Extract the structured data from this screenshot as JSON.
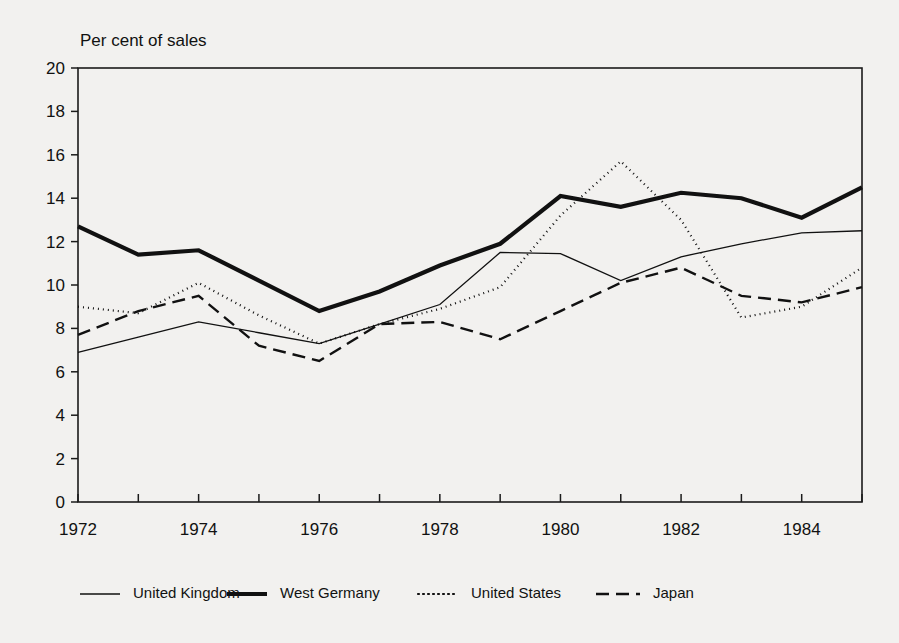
{
  "chart_data": {
    "type": "line",
    "title": "",
    "ylabel": "Per cent of sales",
    "xlabel": "",
    "ylim": [
      0,
      20
    ],
    "xlim": [
      1972,
      1985
    ],
    "ytick_step": 2,
    "yticks": [
      0,
      2,
      4,
      6,
      8,
      10,
      12,
      14,
      16,
      18,
      20
    ],
    "ytick_labels": [
      "0",
      "2",
      "4",
      "6",
      "8",
      "10",
      "12",
      "14",
      "16",
      "18",
      "20"
    ],
    "x": [
      1972,
      1973,
      1974,
      1975,
      1976,
      1977,
      1978,
      1979,
      1980,
      1981,
      1982,
      1983,
      1984,
      1985
    ],
    "xticks": [
      1972,
      1973,
      1974,
      1975,
      1976,
      1977,
      1978,
      1979,
      1980,
      1981,
      1982,
      1983,
      1984,
      1985
    ],
    "xtick_labels": [
      "1972",
      "",
      "1974",
      "",
      "1976",
      "",
      "1978",
      "",
      "1980",
      "",
      "1982",
      "",
      "1984",
      ""
    ],
    "grid": false,
    "legend_position": "bottom",
    "series": [
      {
        "name": "United Kingdom",
        "style": "solid-thin",
        "color": "#111111",
        "width": 1.3,
        "dash": "none",
        "values": [
          6.9,
          7.6,
          8.3,
          7.8,
          7.3,
          8.2,
          9.1,
          11.5,
          11.45,
          10.2,
          11.3,
          11.9,
          12.4,
          12.5
        ]
      },
      {
        "name": "West Germany",
        "style": "solid-thick",
        "color": "#111111",
        "width": 4.2,
        "dash": "none",
        "values": [
          12.7,
          11.4,
          11.6,
          10.2,
          8.8,
          9.7,
          10.9,
          11.9,
          14.1,
          13.6,
          14.25,
          14.0,
          13.1,
          14.5
        ]
      },
      {
        "name": "United States",
        "style": "dotted",
        "color": "#111111",
        "width": 2.2,
        "dash": "1 4",
        "values": [
          9.0,
          8.7,
          10.1,
          8.6,
          7.3,
          8.2,
          8.9,
          9.9,
          13.2,
          15.7,
          13.0,
          8.5,
          9.0,
          10.8
        ]
      },
      {
        "name": "Japan",
        "style": "dashed",
        "color": "#111111",
        "width": 2.4,
        "dash": "13 7",
        "values": [
          7.7,
          8.8,
          9.5,
          7.2,
          6.5,
          8.2,
          8.3,
          7.5,
          8.8,
          10.1,
          10.8,
          9.5,
          9.2,
          9.9
        ]
      }
    ],
    "legend": [
      {
        "label": "United Kingdom",
        "style": "solid-thin"
      },
      {
        "label": "West Germany",
        "style": "solid-thick"
      },
      {
        "label": "United States",
        "style": "dotted"
      },
      {
        "label": "Japan",
        "style": "dashed"
      }
    ]
  },
  "geometry": {
    "plot_left": 78,
    "plot_right": 862,
    "plot_top": 68,
    "plot_bottom": 502,
    "title_x": 80,
    "title_y": 46,
    "legend_y": 594,
    "legend_item_x": [
      80,
      227,
      418,
      596,
      726,
      778
    ]
  }
}
